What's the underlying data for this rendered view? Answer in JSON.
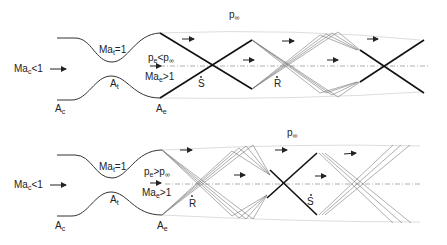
{
  "panels": [
    {
      "id": "overexpanded",
      "inlet_label": "Ma",
      "inlet_sub": "c",
      "inlet_rel": "<1",
      "throat_label": "Ma",
      "throat_sub": "t",
      "throat_rel": "=1",
      "throat_area": "A",
      "throat_area_sub": "t",
      "inlet_area": "A",
      "inlet_area_sub": "c",
      "exit_area": "A",
      "exit_area_sub": "e",
      "pressure_cond": "p",
      "pressure_cond_sub": "e",
      "pressure_cond_rel": "<p",
      "pressure_cond_rel_sub": "∞",
      "exit_mach": "Ma",
      "exit_mach_sub": "e",
      "exit_mach_rel": ">1",
      "ambient": "p",
      "ambient_sub": "∞",
      "marker_1": "S",
      "marker_2": "R"
    },
    {
      "id": "underexpanded",
      "inlet_label": "Ma",
      "inlet_sub": "c",
      "inlet_rel": "<1",
      "throat_label": "Ma",
      "throat_sub": "t",
      "throat_rel": "=1",
      "throat_area": "A",
      "throat_area_sub": "t",
      "inlet_area": "A",
      "inlet_area_sub": "c",
      "exit_area": "A",
      "exit_area_sub": "e",
      "pressure_cond": "p",
      "pressure_cond_sub": "e",
      "pressure_cond_rel": ">p",
      "pressure_cond_rel_sub": "∞",
      "exit_mach": "Ma",
      "exit_mach_sub": "e",
      "exit_mach_rel": ">1",
      "ambient": "p",
      "ambient_sub": "∞",
      "marker_1": "R",
      "marker_2": "S"
    }
  ]
}
